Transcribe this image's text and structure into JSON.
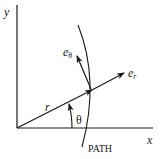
{
  "diagram": {
    "labels": {
      "y_axis": "y",
      "x_axis": "x",
      "radius": "r",
      "angle": "θ",
      "e_theta_base": "e",
      "e_theta_sub": "θ",
      "e_r_base": "e",
      "e_r_sub": "r",
      "path": "PATH"
    },
    "colors": {
      "stroke": "#1a1a1a",
      "background": "#ffffff"
    }
  }
}
